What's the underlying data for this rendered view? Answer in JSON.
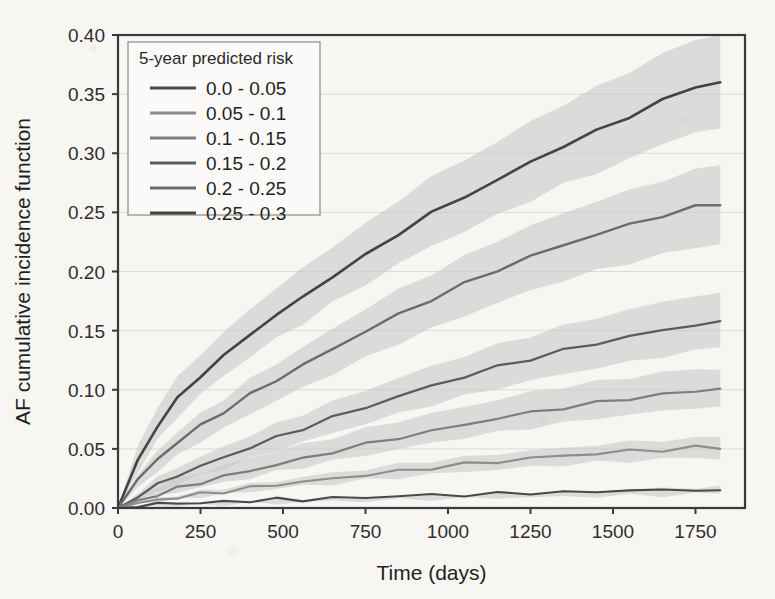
{
  "figure": {
    "background_color": "#f7f6f3",
    "frame_color": "#3a3a3a",
    "grid_color": "#dddad6"
  },
  "legend": {
    "title": "5-year predicted risk",
    "position": "top-left-inside",
    "entries": [
      {
        "label": "0.0 - 0.05",
        "color": "#4a4a4a"
      },
      {
        "label": "0.05 - 0.1",
        "color": "#8d8d8d"
      },
      {
        "label": "0.1 - 0.15",
        "color": "#7e7e7e"
      },
      {
        "label": "0.15 - 0.2",
        "color": "#5c5c5c"
      },
      {
        "label": "0.2 - 0.25",
        "color": "#6b6b6b"
      },
      {
        "label": "0.25 - 0.3",
        "color": "#434343"
      }
    ]
  },
  "chart_data": {
    "type": "line",
    "title": "",
    "xlabel": "Time (days)",
    "ylabel": "AF cumulative incidence function",
    "xlim": [
      0,
      1900
    ],
    "ylim": [
      0.0,
      0.4
    ],
    "xticks": [
      0,
      250,
      500,
      750,
      1000,
      1250,
      1500,
      1750
    ],
    "yticks": [
      0.0,
      0.05,
      0.1,
      0.15,
      0.2,
      0.25,
      0.3,
      0.35,
      0.4
    ],
    "xtick_labels": [
      "0",
      "250",
      "500",
      "750",
      "1000",
      "1250",
      "1500",
      "1750"
    ],
    "ytick_labels": [
      "0.00",
      "0.05",
      "0.10",
      "0.15",
      "0.20",
      "0.25",
      "0.30",
      "0.35",
      "0.40"
    ],
    "grid": true,
    "legend_position": "upper left",
    "confidence_band_color": "#c9c9c9",
    "confidence_band_opacity": 0.62,
    "x": [
      0,
      60,
      120,
      180,
      250,
      320,
      400,
      480,
      560,
      650,
      750,
      850,
      950,
      1050,
      1150,
      1250,
      1350,
      1450,
      1550,
      1650,
      1750,
      1825
    ],
    "series": [
      {
        "name": "0.25 - 0.3",
        "color": "#434343",
        "linewidth": 2.6,
        "values": [
          0.0,
          0.04,
          0.07,
          0.092,
          0.112,
          0.128,
          0.147,
          0.163,
          0.178,
          0.196,
          0.213,
          0.232,
          0.249,
          0.263,
          0.277,
          0.292,
          0.306,
          0.318,
          0.331,
          0.344,
          0.356,
          0.36
        ],
        "ci_lower": [
          0.0,
          0.03,
          0.056,
          0.076,
          0.095,
          0.11,
          0.127,
          0.142,
          0.155,
          0.172,
          0.188,
          0.205,
          0.22,
          0.233,
          0.246,
          0.259,
          0.272,
          0.282,
          0.294,
          0.306,
          0.317,
          0.321
        ],
        "ci_upper": [
          0.0,
          0.051,
          0.085,
          0.109,
          0.13,
          0.147,
          0.168,
          0.185,
          0.202,
          0.221,
          0.239,
          0.26,
          0.279,
          0.294,
          0.309,
          0.326,
          0.341,
          0.355,
          0.369,
          0.383,
          0.396,
          0.4
        ]
      },
      {
        "name": "0.2 - 0.25",
        "color": "#6b6b6b",
        "linewidth": 2.4,
        "values": [
          0.0,
          0.022,
          0.04,
          0.054,
          0.068,
          0.08,
          0.094,
          0.107,
          0.119,
          0.133,
          0.148,
          0.162,
          0.175,
          0.188,
          0.2,
          0.211,
          0.221,
          0.23,
          0.238,
          0.246,
          0.253,
          0.256
        ],
        "ci_lower": [
          0.0,
          0.016,
          0.031,
          0.043,
          0.056,
          0.066,
          0.079,
          0.09,
          0.101,
          0.113,
          0.126,
          0.139,
          0.151,
          0.162,
          0.173,
          0.183,
          0.192,
          0.2,
          0.207,
          0.214,
          0.22,
          0.223
        ],
        "ci_upper": [
          0.0,
          0.029,
          0.05,
          0.066,
          0.081,
          0.094,
          0.11,
          0.124,
          0.137,
          0.153,
          0.17,
          0.186,
          0.2,
          0.214,
          0.228,
          0.24,
          0.251,
          0.261,
          0.27,
          0.279,
          0.287,
          0.29
        ]
      },
      {
        "name": "0.15 - 0.2",
        "color": "#5c5c5c",
        "linewidth": 2.3,
        "values": [
          0.0,
          0.011,
          0.02,
          0.028,
          0.036,
          0.043,
          0.052,
          0.06,
          0.068,
          0.077,
          0.086,
          0.095,
          0.104,
          0.112,
          0.12,
          0.127,
          0.134,
          0.14,
          0.146,
          0.151,
          0.156,
          0.158
        ],
        "ci_lower": [
          0.0,
          0.008,
          0.015,
          0.022,
          0.029,
          0.035,
          0.043,
          0.05,
          0.057,
          0.065,
          0.073,
          0.081,
          0.089,
          0.096,
          0.103,
          0.109,
          0.115,
          0.12,
          0.125,
          0.13,
          0.134,
          0.136
        ],
        "ci_upper": [
          0.0,
          0.014,
          0.026,
          0.035,
          0.044,
          0.052,
          0.062,
          0.071,
          0.08,
          0.09,
          0.1,
          0.11,
          0.12,
          0.129,
          0.138,
          0.146,
          0.154,
          0.161,
          0.168,
          0.174,
          0.18,
          0.182
        ]
      },
      {
        "name": "0.1 - 0.15",
        "color": "#7e7e7e",
        "linewidth": 2.2,
        "values": [
          0.0,
          0.007,
          0.013,
          0.018,
          0.023,
          0.028,
          0.033,
          0.038,
          0.043,
          0.049,
          0.055,
          0.061,
          0.066,
          0.072,
          0.077,
          0.082,
          0.086,
          0.09,
          0.094,
          0.097,
          0.1,
          0.101
        ],
        "ci_lower": [
          0.0,
          0.005,
          0.01,
          0.014,
          0.018,
          0.022,
          0.026,
          0.031,
          0.035,
          0.04,
          0.045,
          0.05,
          0.055,
          0.06,
          0.064,
          0.068,
          0.072,
          0.076,
          0.079,
          0.082,
          0.085,
          0.086
        ],
        "ci_upper": [
          0.0,
          0.009,
          0.017,
          0.023,
          0.029,
          0.034,
          0.041,
          0.046,
          0.052,
          0.058,
          0.065,
          0.072,
          0.078,
          0.084,
          0.09,
          0.096,
          0.101,
          0.105,
          0.109,
          0.113,
          0.116,
          0.117
        ]
      },
      {
        "name": "0.05 - 0.1",
        "color": "#8d8d8d",
        "linewidth": 2.1,
        "values": [
          0.0,
          0.003,
          0.006,
          0.008,
          0.011,
          0.013,
          0.016,
          0.019,
          0.021,
          0.024,
          0.027,
          0.03,
          0.033,
          0.036,
          0.038,
          0.041,
          0.043,
          0.045,
          0.047,
          0.048,
          0.05,
          0.05
        ],
        "ci_lower": [
          0.0,
          0.002,
          0.004,
          0.006,
          0.008,
          0.01,
          0.012,
          0.015,
          0.017,
          0.019,
          0.022,
          0.024,
          0.027,
          0.029,
          0.031,
          0.033,
          0.035,
          0.037,
          0.038,
          0.04,
          0.041,
          0.041
        ],
        "ci_upper": [
          0.0,
          0.004,
          0.008,
          0.011,
          0.014,
          0.017,
          0.02,
          0.023,
          0.026,
          0.03,
          0.033,
          0.037,
          0.04,
          0.043,
          0.046,
          0.049,
          0.051,
          0.054,
          0.056,
          0.058,
          0.059,
          0.06
        ]
      },
      {
        "name": "0.0 - 0.05",
        "color": "#4a4a4a",
        "linewidth": 2.1,
        "values": [
          0.0,
          0.001,
          0.002,
          0.003,
          0.003,
          0.004,
          0.005,
          0.006,
          0.006,
          0.007,
          0.008,
          0.009,
          0.01,
          0.01,
          0.011,
          0.012,
          0.012,
          0.013,
          0.014,
          0.014,
          0.015,
          0.015
        ],
        "ci_lower": [
          0.0,
          0.001,
          0.001,
          0.002,
          0.002,
          0.003,
          0.004,
          0.004,
          0.005,
          0.006,
          0.006,
          0.007,
          0.008,
          0.008,
          0.009,
          0.009,
          0.01,
          0.01,
          0.011,
          0.011,
          0.012,
          0.012
        ],
        "ci_upper": [
          0.0,
          0.002,
          0.003,
          0.004,
          0.005,
          0.006,
          0.007,
          0.008,
          0.008,
          0.009,
          0.01,
          0.011,
          0.012,
          0.013,
          0.014,
          0.015,
          0.015,
          0.016,
          0.017,
          0.018,
          0.019,
          0.019
        ]
      }
    ]
  }
}
